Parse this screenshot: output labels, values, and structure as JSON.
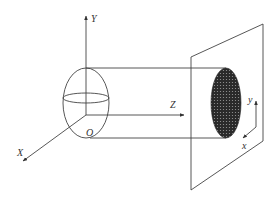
{
  "diagram": {
    "type": "3d-coordinate-projection",
    "labels": {
      "Y": "Y",
      "Z": "Z",
      "X": "X",
      "O": "O",
      "y_small": "y",
      "x_small": "x"
    },
    "colors": {
      "line": "#444444",
      "shaded_ellipse": "#2a2a2a",
      "background": "#ffffff"
    },
    "elements": [
      "Y axis (vertical, arrow up)",
      "Z axis (horizontal, arrow right)",
      "X axis (diagonal down-left)",
      "origin O",
      "ellipse cross-section at origin",
      "cylinder projection lines",
      "projection plane (parallelogram)",
      "shaded ellipse on plane",
      "local x/y axes on plane"
    ]
  }
}
